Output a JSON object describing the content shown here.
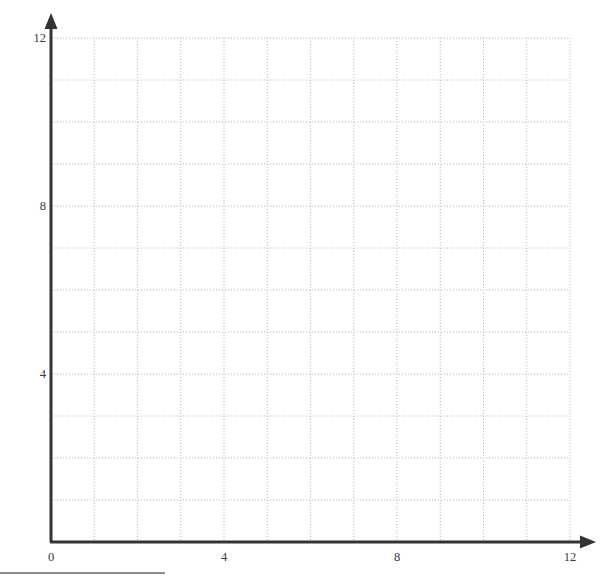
{
  "chart_data": {
    "type": "scatter",
    "title": "",
    "subtitle": "",
    "xlabel": "",
    "ylabel": "",
    "xlim": [
      0,
      12
    ],
    "ylim": [
      0,
      12
    ],
    "x_tick_labels": [
      "0",
      "4",
      "8",
      "12"
    ],
    "x_tick_values": [
      0,
      4,
      8,
      12
    ],
    "y_tick_labels": [
      "4",
      "8",
      "12"
    ],
    "y_tick_values": [
      4,
      8,
      12
    ],
    "grid": true,
    "grid_style": "dotted",
    "grid_step": 1,
    "legend": null,
    "series": [],
    "annotations": [],
    "data_points": []
  },
  "figure": {
    "axis_color": "#333333",
    "grid_color": "#b5b5b5",
    "label_color": "#3a3a3a",
    "background_color": "#ffffff",
    "rule_color": "#8d8d8d",
    "x_axis_arrow": "arrow-right",
    "y_axis_arrow": "arrow-up"
  },
  "labels": {
    "y": [
      {
        "text": "12",
        "value": 12
      },
      {
        "text": "8",
        "value": 8
      },
      {
        "text": "4",
        "value": 4
      }
    ],
    "x": [
      {
        "text": "0",
        "value": 0
      },
      {
        "text": "4",
        "value": 4
      },
      {
        "text": "8",
        "value": 8
      },
      {
        "text": "12",
        "value": 12
      }
    ]
  }
}
